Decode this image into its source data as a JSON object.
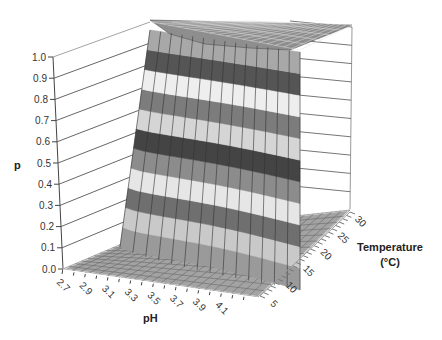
{
  "chart_data": {
    "type": "surface3d",
    "title": "",
    "zlabel": "p",
    "xlabel": "pH",
    "ylabel": "Temperature (°C)",
    "ylabel_lines": [
      "Temperature",
      "(°C)"
    ],
    "z_ticks": [
      "0.0",
      "0.1",
      "0.2",
      "0.3",
      "0.4",
      "0.5",
      "0.6",
      "0.7",
      "0.8",
      "0.9",
      "1.0"
    ],
    "x_ticks": [
      "2.7",
      "2.9",
      "3.1",
      "3.3",
      "3.5",
      "3.7",
      "3.9",
      "4.1"
    ],
    "y_ticks": [
      "5",
      "10",
      "15",
      "20",
      "25",
      "30"
    ],
    "zlim": [
      0,
      1
    ],
    "xlim": [
      2.7,
      4.2
    ],
    "ylim": [
      5,
      30
    ],
    "grid": true,
    "legend": "none",
    "band_colors": [
      "#9a9a9a",
      "#c9c9c9",
      "#6f6f6f",
      "#e6e6e6",
      "#8c8c8c",
      "#444444",
      "#d5d5d5",
      "#7c7c7c",
      "#eeeeee",
      "#555555",
      "#a8a8a8"
    ],
    "boundary_samples": [
      {
        "pH": 2.7,
        "temp_at_p05": 30
      },
      {
        "pH": 3.1,
        "temp_at_p05": 27
      },
      {
        "pH": 3.5,
        "temp_at_p05": 22
      },
      {
        "pH": 3.9,
        "temp_at_p05": 15
      },
      {
        "pH": 4.1,
        "temp_at_p05": 10
      }
    ]
  }
}
